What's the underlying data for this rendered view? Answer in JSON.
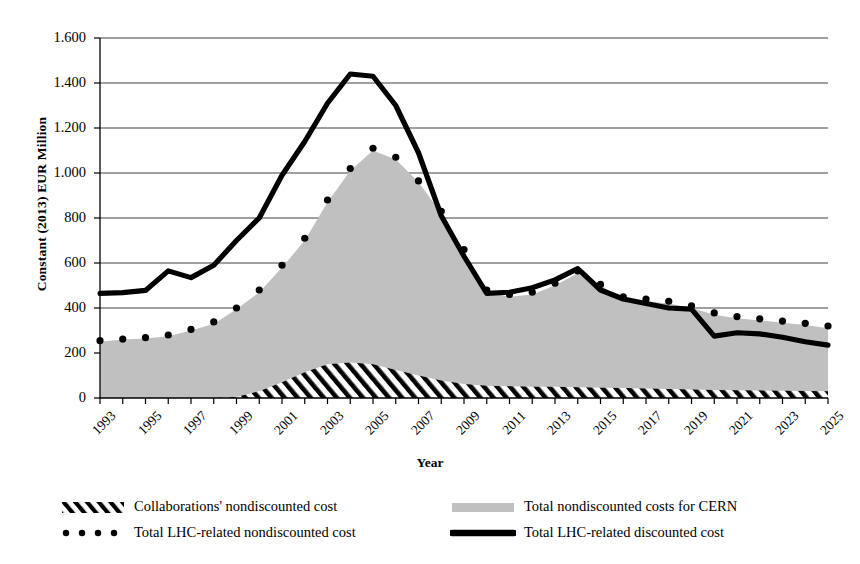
{
  "chart_data": {
    "type": "area",
    "title": "",
    "xlabel": "Year",
    "ylabel": "Constant (2013) EUR Million",
    "ylim": [
      0,
      1600
    ],
    "ytick_step": 200,
    "grid": true,
    "legend_position": "bottom",
    "x": [
      1993,
      1994,
      1995,
      1996,
      1997,
      1998,
      1999,
      2000,
      2001,
      2002,
      2003,
      2004,
      2005,
      2006,
      2007,
      2008,
      2009,
      2010,
      2011,
      2012,
      2013,
      2014,
      2015,
      2016,
      2017,
      2018,
      2019,
      2020,
      2021,
      2022,
      2023,
      2024,
      2025
    ],
    "ytick_labels": [
      "0",
      "200",
      "400",
      "600",
      "800",
      "1.000",
      "1.200",
      "1.400",
      "1.600"
    ],
    "ytick_values": [
      0,
      200,
      400,
      600,
      800,
      1000,
      1200,
      1400,
      1600
    ],
    "xtick_labels": [
      "1993",
      "1995",
      "1997",
      "1999",
      "2001",
      "2003",
      "2005",
      "2007",
      "2009",
      "2011",
      "2013",
      "2015",
      "2017",
      "2019",
      "2021",
      "2023",
      "2025"
    ],
    "series": [
      {
        "name": "Collaborations' nondiscounted cost",
        "style": "hatched-area",
        "color": "#000000",
        "values": [
          0,
          0,
          0,
          0,
          0,
          0,
          5,
          30,
          70,
          115,
          150,
          158,
          150,
          125,
          100,
          78,
          62,
          55,
          52,
          50,
          50,
          48,
          46,
          44,
          42,
          40,
          38,
          36,
          34,
          33,
          32,
          31,
          30
        ]
      },
      {
        "name": "Total nondiscounted costs for CERN",
        "style": "filled-area",
        "color": "#c0c0c0",
        "values": [
          250,
          260,
          265,
          275,
          300,
          330,
          395,
          470,
          580,
          700,
          870,
          1010,
          1100,
          1060,
          960,
          820,
          650,
          470,
          450,
          460,
          500,
          555,
          500,
          440,
          430,
          420,
          400,
          370,
          355,
          345,
          335,
          325,
          310
        ]
      },
      {
        "name": "Total LHC-related  nondiscounted cost",
        "style": "dotted-line",
        "color": "#000000",
        "values": [
          255,
          262,
          268,
          280,
          305,
          338,
          400,
          480,
          590,
          710,
          880,
          1020,
          1110,
          1070,
          965,
          830,
          660,
          480,
          460,
          470,
          510,
          565,
          505,
          450,
          440,
          430,
          410,
          378,
          362,
          352,
          342,
          332,
          320
        ]
      },
      {
        "name": "Total LHC-related discounted cost",
        "style": "thick-line",
        "color": "#000000",
        "values": [
          465,
          468,
          478,
          565,
          535,
          590,
          700,
          800,
          990,
          1140,
          1310,
          1440,
          1430,
          1300,
          1090,
          810,
          630,
          465,
          470,
          490,
          525,
          575,
          480,
          440,
          420,
          400,
          395,
          275,
          290,
          285,
          270,
          250,
          235
        ]
      }
    ]
  },
  "axis": {
    "ytitle": "Constant (2013) EUR Million",
    "xtitle": "Year"
  },
  "legend": {
    "items": [
      {
        "label": "Collaborations' nondiscounted cost",
        "style": "hatched-area"
      },
      {
        "label": "Total nondiscounted costs for CERN",
        "style": "filled-area"
      },
      {
        "label": "Total LHC-related  nondiscounted cost",
        "style": "dotted-line"
      },
      {
        "label": "Total LHC-related discounted cost",
        "style": "thick-line"
      }
    ]
  },
  "colors": {
    "area_fill": "#c0c0c0",
    "line": "#000000",
    "grid": "#808080",
    "background": "#ffffff"
  }
}
